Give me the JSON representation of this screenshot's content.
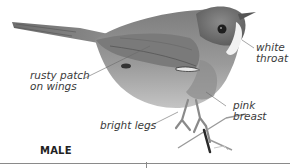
{
  "figure": {
    "caption_tag": "MALE",
    "annotations": [
      {
        "id": "rusty-patch",
        "text_line1": "rusty patch",
        "text_line2": "on wings"
      },
      {
        "id": "white-throat",
        "text_line1": "white",
        "text_line2": "throat"
      },
      {
        "id": "pink-breast",
        "text_line1": "pink",
        "text_line2": "breast"
      },
      {
        "id": "bright-legs",
        "text_line1": "bright legs"
      }
    ],
    "colors": {
      "background": "#ffffff",
      "text": "#3a3a3a",
      "leader_line": "#6a6a6a",
      "rule": "#8a8a8a"
    }
  }
}
